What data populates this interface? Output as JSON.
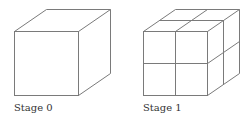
{
  "figure": {
    "stages": [
      {
        "label": "Stage 0",
        "subdivisions": 1
      },
      {
        "label": "Stage 1",
        "subdivisions": 2
      }
    ],
    "line_color": "#7a7a7a"
  }
}
